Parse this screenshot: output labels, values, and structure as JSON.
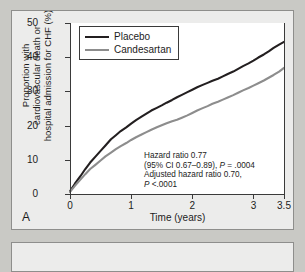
{
  "panel": {
    "letter": "A"
  },
  "chart_data": {
    "type": "line",
    "title": "",
    "xlabel": "Time (years)",
    "ylabel": "Proportion with cardiovascular death or hospital admission for CHF (%)",
    "ylabel_lines": [
      "Proportion with",
      "cardiovascular death or",
      "hospital admission for CHF (%)"
    ],
    "xlim": [
      0,
      3.5
    ],
    "ylim": [
      0,
      50
    ],
    "xticks": [
      0,
      1,
      2,
      3,
      3.5
    ],
    "xtick_labels": [
      "0",
      "1",
      "2",
      "3",
      "3.5"
    ],
    "yticks": [
      0,
      10,
      20,
      30,
      40,
      50
    ],
    "ytick_labels": [
      "0",
      "10",
      "20",
      "30",
      "40",
      "50"
    ],
    "grid": false,
    "legend_position": "top-left",
    "colors": {
      "placebo": "#231f20",
      "candesartan": "#8d8d8d"
    },
    "series": [
      {
        "name": "Placebo",
        "color": "#231f20",
        "x": [
          0,
          0.08,
          0.17,
          0.25,
          0.33,
          0.42,
          0.5,
          0.58,
          0.67,
          0.75,
          0.83,
          0.92,
          1.0,
          1.08,
          1.17,
          1.25,
          1.33,
          1.42,
          1.5,
          1.58,
          1.67,
          1.75,
          1.83,
          1.92,
          2.0,
          2.08,
          2.17,
          2.25,
          2.33,
          2.42,
          2.5,
          2.58,
          2.67,
          2.75,
          2.83,
          2.92,
          3.0,
          3.08,
          3.17,
          3.25,
          3.33,
          3.42,
          3.5
        ],
        "values": [
          0.8,
          3.0,
          5.2,
          7.3,
          9.2,
          11.0,
          12.6,
          14.2,
          16.0,
          17.2,
          18.4,
          19.5,
          20.6,
          21.6,
          22.6,
          23.5,
          24.4,
          25.2,
          25.9,
          26.7,
          27.5,
          28.3,
          29.0,
          29.8,
          30.5,
          31.2,
          31.9,
          32.5,
          33.1,
          33.7,
          34.4,
          35.1,
          35.8,
          36.6,
          37.4,
          38.2,
          39.0,
          39.9,
          40.8,
          41.7,
          42.7,
          43.7,
          44.5
        ]
      },
      {
        "name": "Candesartan",
        "color": "#8d8d8d",
        "x": [
          0,
          0.08,
          0.17,
          0.25,
          0.33,
          0.42,
          0.5,
          0.58,
          0.67,
          0.75,
          0.83,
          0.92,
          1.0,
          1.08,
          1.17,
          1.25,
          1.33,
          1.42,
          1.5,
          1.58,
          1.67,
          1.75,
          1.83,
          1.92,
          2.0,
          2.08,
          2.17,
          2.25,
          2.33,
          2.42,
          2.5,
          2.58,
          2.67,
          2.75,
          2.83,
          2.92,
          3.0,
          3.08,
          3.17,
          3.25,
          3.33,
          3.42,
          3.5
        ],
        "values": [
          0.6,
          2.4,
          4.2,
          5.8,
          7.3,
          8.6,
          9.8,
          11.0,
          12.1,
          13.1,
          14.0,
          14.9,
          15.8,
          16.6,
          17.4,
          18.1,
          18.8,
          19.5,
          20.1,
          20.7,
          21.3,
          21.7,
          22.3,
          23.0,
          23.7,
          24.4,
          25.1,
          25.7,
          26.4,
          27.0,
          27.6,
          28.2,
          28.9,
          29.6,
          30.3,
          31.0,
          31.7,
          32.4,
          33.2,
          34.0,
          34.8,
          35.8,
          36.9
        ]
      }
    ],
    "legend": [
      {
        "label": "Placebo",
        "color": "#231f20"
      },
      {
        "label": "Candesartan",
        "color": "#8d8d8d"
      }
    ],
    "annotations": [
      "Hazard ratio 0.77",
      "(95% CI 0.67–0.89), P = .0004",
      "Adjusted hazard ratio 0.70,",
      "P <.0001"
    ],
    "annotation_parts": {
      "line1": "Hazard ratio 0.77",
      "line2_a": "(95% CI 0.67–0.89), ",
      "line2_p": "P",
      "line2_b": " = .0004",
      "line3": "Adjusted hazard ratio 0.70,",
      "line4_p": "P",
      "line4_b": " <.0001"
    }
  }
}
